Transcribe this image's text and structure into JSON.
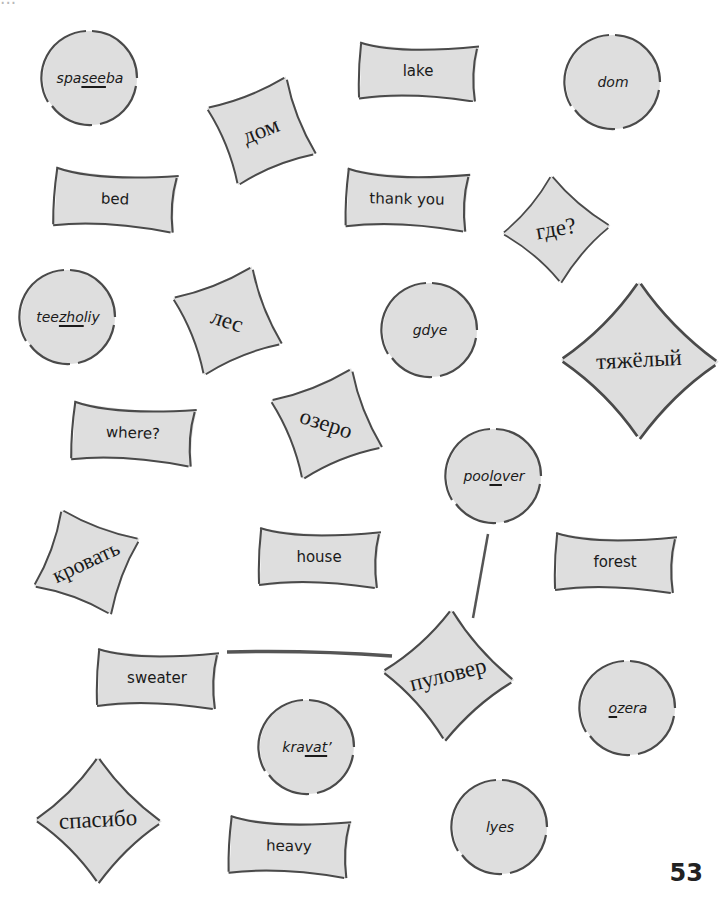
{
  "page": {
    "top_text": "...",
    "page_number": "53",
    "colors": {
      "card_fill": "#dedede",
      "card_stroke": "#4a4a4a",
      "connector": "#555555"
    }
  },
  "cards": {
    "spaseeba": {
      "pre": "spa",
      "u": "see",
      "post": "ba",
      "kind": "circle"
    },
    "dom_ru": {
      "text": "дом",
      "kind": "square"
    },
    "lake": {
      "text": "lake",
      "kind": "rect"
    },
    "dom_tr": {
      "text": "dom",
      "kind": "circle"
    },
    "bed": {
      "text": "bed",
      "kind": "rect"
    },
    "thank_you": {
      "text": "thank you",
      "kind": "rect"
    },
    "gde_ru": {
      "text": "где?",
      "kind": "square"
    },
    "teezholiy": {
      "pre": "tee",
      "u": "zho",
      "post": "liy",
      "kind": "circle"
    },
    "les_ru": {
      "text": "лес",
      "kind": "square"
    },
    "gdye": {
      "text": "gdye",
      "kind": "circle"
    },
    "tyazholiy_ru": {
      "text": "тяжёлый",
      "kind": "diamond"
    },
    "where": {
      "text": "where?",
      "kind": "rect"
    },
    "ozero_ru": {
      "text": "озеро",
      "kind": "square"
    },
    "poolover": {
      "pre": "poo",
      "u": "lo",
      "post": "ver",
      "kind": "circle"
    },
    "krovat_ru": {
      "text": "кровать",
      "kind": "square"
    },
    "house": {
      "text": "house",
      "kind": "rect"
    },
    "forest": {
      "text": "forest",
      "kind": "rect"
    },
    "sweater": {
      "text": "sweater",
      "kind": "rect"
    },
    "pulover_ru": {
      "text": "пуловер",
      "kind": "diamond"
    },
    "ozera": {
      "pre": "",
      "u": "o",
      "post": "zera",
      "kind": "circle"
    },
    "kravat": {
      "pre": "kra",
      "u": "vat",
      "post": "’",
      "kind": "circle"
    },
    "spasibo_ru": {
      "text": "спасибо",
      "kind": "diamond"
    },
    "heavy": {
      "text": "heavy",
      "kind": "rect"
    },
    "lyes": {
      "text": "lyes",
      "kind": "circle"
    }
  },
  "connections": [
    {
      "from": "sweater",
      "to": "pulover_ru"
    },
    {
      "from": "poolover",
      "to": "pulover_ru"
    }
  ]
}
